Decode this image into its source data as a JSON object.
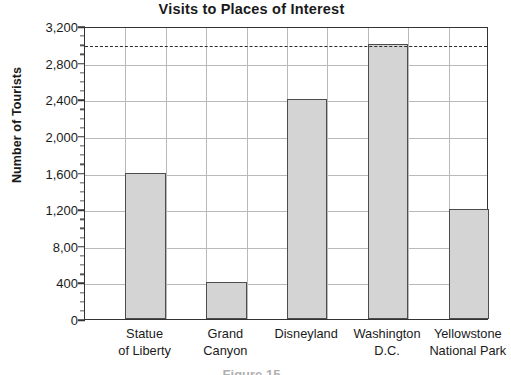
{
  "chart_data": {
    "type": "bar",
    "title": "Visits to Places of Interest",
    "xlabel": "",
    "ylabel": "Number of Tourists",
    "categories": [
      "Statue of Liberty",
      "Grand Canyon",
      "Disneyland",
      "Washington D.C.",
      "Yellowstone National Park"
    ],
    "category_lines": [
      [
        "Statue",
        "of Liberty"
      ],
      [
        "Grand",
        "Canyon"
      ],
      [
        "Disneyland",
        ""
      ],
      [
        "Washington",
        "D.C."
      ],
      [
        "Yellowstone",
        "National Park"
      ]
    ],
    "values": [
      1600,
      400,
      2400,
      3000,
      1200
    ],
    "ylim": [
      0,
      3200
    ],
    "ytick_values": [
      0,
      400,
      800,
      1200,
      1600,
      2000,
      2400,
      2800,
      3200
    ],
    "ytick_labels": [
      "0",
      "400",
      "8,00",
      "1,200",
      "1,600",
      "2,000",
      "2,400",
      "2,800",
      "3,200"
    ],
    "minor_tick_step": 100,
    "grid": true,
    "grid_axis": "both",
    "legend": "none",
    "annotations": [
      {
        "name": "reference-line",
        "type": "dashed-horizontal-line",
        "value": 3000,
        "label": ""
      }
    ],
    "bar_fill_color": "#d4d4d4",
    "bar_edge_color": "#4d4d4d",
    "grid_color": "#b9b9b9",
    "axis_color": "#333333",
    "text_color": "#1a1a1a"
  },
  "caption": {
    "clipped_text": "Figure 15"
  }
}
